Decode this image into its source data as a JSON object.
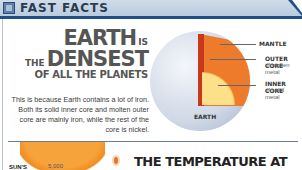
{
  "header": {
    "title": "FAST FACTS",
    "logo_icon": "fast-facts-logo-icon"
  },
  "headline": {
    "line1_big": "EARTH",
    "line1_small": "IS",
    "line2_small": "THE",
    "line2_big": "DENSEST",
    "line3": "OF ALL THE PLANETS"
  },
  "body_text": "This is because Earth contains a lot of iron. Both its solid inner core and molten outer core are mainly iron, while the rest of the core is nickel.",
  "diagram": {
    "labels": {
      "mantle": "MANTLE",
      "outer_core": "OUTER CORE",
      "outer_core_desc": "of molten metal",
      "inner_core": "INNER CORE",
      "inner_core_desc": "of solid metal",
      "earth": "EARTH"
    },
    "colors": {
      "mantle": "#ee7b2c",
      "crust_edge": "#c9371c",
      "inner_core": "#fde18a",
      "globe": "#cfd8e6"
    }
  },
  "bottom": {
    "sun_label": "SUN'S",
    "sun_value": "5,000",
    "next_title": "THE TEMPERATURE AT"
  },
  "colors": {
    "header_bar": "#b9cbdd",
    "header_border": "#1f4f86",
    "headline": "#555555"
  }
}
